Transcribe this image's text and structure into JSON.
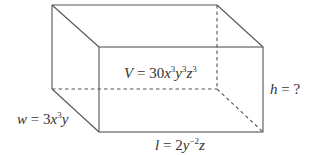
{
  "diagram": {
    "type": "rectangular-prism",
    "colors": {
      "edge": "#555555",
      "text": "#333333",
      "background": "#ffffff"
    },
    "vertices": {
      "back_top_left": [
        52,
        5
      ],
      "back_top_right": [
        217,
        5
      ],
      "back_bottom_left": [
        52,
        89
      ],
      "back_bottom_right": [
        217,
        89
      ],
      "front_top_left": [
        99,
        47
      ],
      "front_top_right": [
        263,
        47
      ],
      "front_bottom_left": [
        99,
        132
      ],
      "front_bottom_right": [
        263,
        132
      ]
    },
    "labels": {
      "volume": {
        "var": "V",
        "eq": " = ",
        "coef": "30",
        "x": "x",
        "x_exp": "3",
        "y": "y",
        "y_exp": "3",
        "z": "z",
        "z_exp": "3",
        "full_text": "V = 30x^3y^3z^3"
      },
      "height": {
        "var": "h",
        "eq": " = ",
        "value": "?",
        "full_text": "h = ?"
      },
      "width": {
        "var": "w",
        "eq": " = ",
        "coef": "3",
        "x": "x",
        "x_exp": "3",
        "y": "y",
        "full_text": "w = 3x^3y"
      },
      "length": {
        "var": "l",
        "eq": " = ",
        "coef": "2",
        "y": "y",
        "y_exp": "−2",
        "z": "z",
        "full_text": "l = 2y^-2z"
      }
    }
  }
}
